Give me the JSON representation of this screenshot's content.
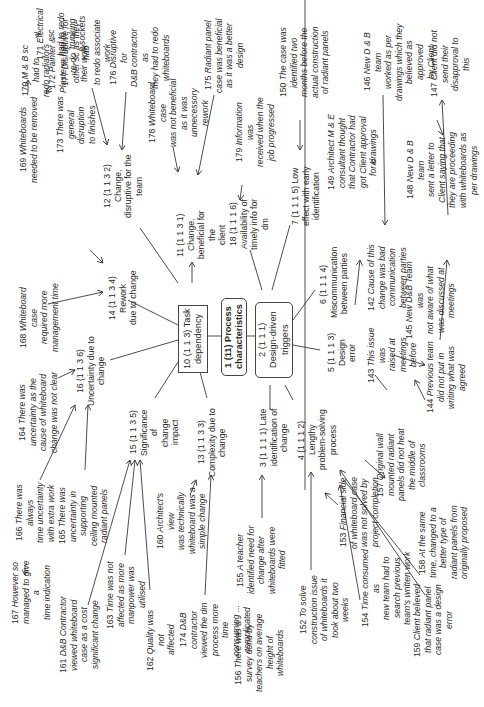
{
  "diagram": {
    "title": "1 (11) Process characteristics",
    "orientation": "rotated 90° counter-clockwise",
    "central": {
      "label": "1 (11) Process\ncharacteristics"
    },
    "categories": [
      {
        "id": "n10",
        "label": "10 (1 1 3) Task\ndependency"
      },
      {
        "id": "n2",
        "label": "2 (1 1 1)\nDesign-driven\ntriggers"
      }
    ],
    "themes": {
      "n11": "11 (1 1 3 1) Change,\nbeneficial for the\nclient",
      "n12": "12 (1 1 3 2) Change,\ndisruptive for the\nteam",
      "n13": "13 (1 1 3 3)\nComplexity due to\nchange",
      "n14": "14 (1 1 3 4) Rework\ndue to change",
      "n15": "15 (1 1 3 5)\nSignificance of\nchange impact",
      "n16": "16 (1 1 3 6)\nUncertainty due to\nchange",
      "n18": "18 (1 1 1 6)\nAvailability of\ntimely info for dm",
      "n7": "7 (1 1 1 5) Low\neffect with early\nidentification",
      "n6": "6 (1 1 1 4)\nMiscommunication\nbetween parties",
      "n5": "5 (1 1 1 3) Design\nerror",
      "n4": "4 (1 1 1 2) Lengthy\nproblem-solving\nprocess",
      "n3": "3 (1 1 1 1) Late\nidentification of\nchange"
    },
    "evidence": {
      "e171": {
        "num": "171",
        "text": "Electrical sc\nhad to redo trunking\n& sockets"
      },
      "e177": {
        "num": "177",
        "text": "Disruptive for\nother sc as they had\nto redo associate\nwork"
      },
      "e170": {
        "num": "170",
        "text": "M & B sc had to\nredo radiators"
      },
      "e172": {
        "num": "172",
        "text": "Painter &\nPlasterer had to re-do\ntheir work"
      },
      "e176": {
        "num": "176",
        "text": "Disruptive for\nD&B contractor as\nthey had to redo\nwhiteboards"
      },
      "e178": {
        "num": "178",
        "text": "Whiteboard case\nwas not beneficial\nas it was\nunnecessory rework"
      },
      "e175": {
        "num": "175",
        "text": "Radiant panel\ncase was beneficial\nas it was a better\ndesign"
      },
      "e179": {
        "num": "179",
        "text": "Information was\nreceived when the\njob progressed"
      },
      "e169": {
        "num": "169",
        "text": "Whiteboards\nneeded to be removed"
      },
      "e173": {
        "num": "173",
        "text": "There was\ngeneral disruption\nto finishes"
      },
      "e168": {
        "num": "168",
        "text": "Whiteboard case\nrequired more\nmanagement time"
      },
      "e164": {
        "num": "164",
        "text": "There was\nuncertainty as the\ncause of whiteboard\nchange was not clear"
      },
      "e166": {
        "num": "166",
        "text": "There was always\ntime uncertainty\nwith extra work"
      },
      "e165": {
        "num": "165",
        "text": "There was\nuncertainty in\nsupporting\nceiling mounted\nradiant panels"
      },
      "e167": {
        "num": "167",
        "text": "However so\nmanaged to give a\ntime indication"
      },
      "e161": {
        "num": "161",
        "text": "D&B Contractor\nviewed whiteboard\ncase as a cost\nsignificant change"
      },
      "e163": {
        "num": "163",
        "text": "Time was not\naffected as more\nmanpower was\nutilised"
      },
      "e162": {
        "num": "162",
        "text": "Quality was not\naffected"
      },
      "e160": {
        "num": "160",
        "text": "Architect's view\nwas technically\nwhiteboard was a\nsimple change"
      },
      "e174": {
        "num": "174",
        "text": "D&B contractor\nviewed the dm\nprocess more time\nconsuming ...\ncomplicated"
      },
      "e155": {
        "num": "155",
        "text": "A teacher\nidentified need for\nchange after\nwhiteboards were\nfitted"
      },
      "e156": {
        "num": "156",
        "text": "There was a\nsurvey done by\nteachers on average\nheight of\nwhiteboards"
      },
      "e152": {
        "num": "152",
        "text": "To solve\nconstruction issue\nof whiteboards it\ntook about two weeks"
      },
      "e153": {
        "num": "153",
        "text": "Financial side\nof whiteboard case\nwas not solved by\nproject completion"
      },
      "e154": {
        "num": "154",
        "text": "Time consumed as\nnew team had to\nsearch previous\nteam's written work"
      },
      "e157": {
        "num": "157",
        "text": "Original wall\nmounted radiant\npanels did not heat\nthe middle of\nclassrooms"
      },
      "e158": {
        "num": "158",
        "text": "At the same\ntime, changed to a\nbetter type of\nradiant panels from\noriginally proposed"
      },
      "e159": {
        "num": "159",
        "text": "Client believed\nthat radiant panel\ncase was a design\nerror"
      },
      "e150": {
        "num": "150",
        "text": "The case was\nidentified two\nmonths before the\nactual construction\nof radiant panels"
      },
      "e149": {
        "num": "149",
        "text": "Architect M & E\nconsultant thought\nthat Contractor had\ngot Client approval\nfor drawings"
      },
      "e146": {
        "num": "146",
        "text": "New D & B team\nworked as per\ndrawings which they\nbelieved as approved\nby Client"
      },
      "e147": {
        "num": "147",
        "text": "Client did not\nsend their\ndisapproval to this"
      },
      "e148": {
        "num": "148",
        "text": "New D & B team\nsent a letter to\nClient saying that\nthey are proceeding\nwith whiteboards as\nper drawings"
      },
      "e142": {
        "num": "142",
        "text": "Cause of this\nchange was bad\ncommunication\nbetween parties"
      },
      "e143": {
        "num": "143",
        "text": "This issue was\nraised at meetings\nbefore"
      },
      "e145": {
        "num": "145",
        "text": "New D&B Team was\nnot aware of what\nwas discussed at\nmeetings"
      },
      "e144": {
        "num": "144",
        "text": "Previous team\ndid not put in\nwriting what was\nagreed"
      }
    }
  },
  "colors": {
    "line": "#3a3a3a",
    "text": "#2a2a2a",
    "background": "#ffffff"
  }
}
